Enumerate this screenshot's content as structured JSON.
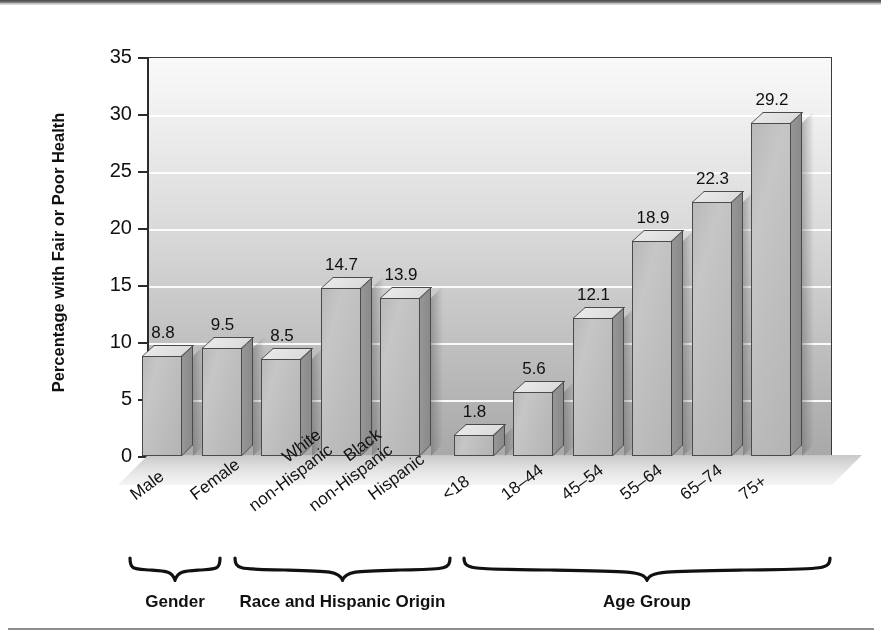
{
  "chart_data": {
    "type": "bar",
    "title": "",
    "subtitle": "",
    "xlabel": "",
    "ylabel": "Percentage with Fair or Poor Health",
    "ylim": [
      0,
      35
    ],
    "yticks": [
      0,
      5,
      10,
      15,
      20,
      25,
      30,
      35
    ],
    "ytick_labels": [
      "0",
      "5",
      "10",
      "15",
      "20",
      "25",
      "30",
      "35"
    ],
    "grid": true,
    "legend": null,
    "categories": [
      "Male",
      "Female",
      "White non-Hispanic",
      "Black non-Hispanic",
      "Hispanic",
      "<18",
      "18–44",
      "45–54",
      "55–64",
      "65–74",
      "75+"
    ],
    "values": [
      8.8,
      9.5,
      8.5,
      14.7,
      13.9,
      1.8,
      5.6,
      12.1,
      18.9,
      22.3,
      29.2
    ],
    "value_labels": [
      "8.8",
      "9.5",
      "8.5",
      "14.7",
      "13.9",
      "1.8",
      "5.6",
      "12.1",
      "18.9",
      "22.3",
      "29.2"
    ],
    "groups": [
      {
        "label": "Gender",
        "categories": [
          "Male",
          "Female"
        ]
      },
      {
        "label": "Race and Hispanic Origin",
        "categories": [
          "White non-Hispanic",
          "Black non-Hispanic",
          "Hispanic"
        ]
      },
      {
        "label": "Age Group",
        "categories": [
          "<18",
          "18–44",
          "45–54",
          "55–64",
          "65–74",
          "75+"
        ]
      }
    ],
    "style": {
      "bar_fill": "#bdbdbd",
      "bar_edge": "#4a4a4a",
      "gridline_color": "#ffffff",
      "axis_color": "#2b2b2b",
      "text_color": "#111111",
      "plot_background_top": "#fbfbfb",
      "plot_background_bottom": "#aaaaaa",
      "three_d": true
    }
  },
  "axis": {
    "y_title": "Percentage with Fair or Poor Health",
    "tick_35": "35",
    "tick_30": "30",
    "tick_25": "25",
    "tick_20": "20",
    "tick_15": "15",
    "tick_10": "10",
    "tick_5": "5",
    "tick_0": "0"
  },
  "bars": [
    {
      "category": "Male",
      "line1": "Male",
      "line2": "",
      "value": 8.8,
      "value_label": "8.8"
    },
    {
      "category": "Female",
      "line1": "Female",
      "line2": "",
      "value": 9.5,
      "value_label": "9.5"
    },
    {
      "category": "White non-Hispanic",
      "line1": "White",
      "line2": "non-Hispanic",
      "value": 8.5,
      "value_label": "8.5"
    },
    {
      "category": "Black non-Hispanic",
      "line1": "Black",
      "line2": "non-Hispanic",
      "value": 14.7,
      "value_label": "14.7"
    },
    {
      "category": "Hispanic",
      "line1": "Hispanic",
      "line2": "",
      "value": 13.9,
      "value_label": "13.9"
    },
    {
      "category": "<18",
      "line1": "<18",
      "line2": "",
      "value": 1.8,
      "value_label": "1.8"
    },
    {
      "category": "18–44",
      "line1": "18–44",
      "line2": "",
      "value": 5.6,
      "value_label": "5.6"
    },
    {
      "category": "45–54",
      "line1": "45–54",
      "line2": "",
      "value": 12.1,
      "value_label": "12.1"
    },
    {
      "category": "55–64",
      "line1": "55–64",
      "line2": "",
      "value": 18.9,
      "value_label": "18.9"
    },
    {
      "category": "65–74",
      "line1": "65–74",
      "line2": "",
      "value": 22.3,
      "value_label": "22.3"
    },
    {
      "category": "75+",
      "line1": "75+",
      "line2": "",
      "value": 29.2,
      "value_label": "29.2"
    }
  ],
  "groups": [
    {
      "label": "Gender"
    },
    {
      "label": "Race and Hispanic Origin"
    },
    {
      "label": "Age Group"
    }
  ]
}
